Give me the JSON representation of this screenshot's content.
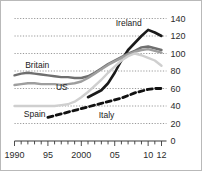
{
  "chart_data": {
    "type": "line",
    "title": "",
    "subtitle": "",
    "xlabel": "",
    "ylabel": "",
    "xlim": [
      1990,
      2012
    ],
    "ylim": [
      0,
      140
    ],
    "grid": true,
    "y_axis_position": "right",
    "legend": "inline-labels",
    "yticks": [
      0,
      20,
      40,
      60,
      80,
      100,
      120,
      140
    ],
    "ytick_labels": [
      "0",
      "20",
      "40",
      "60",
      "80",
      "100",
      "120",
      "140"
    ],
    "xticks": [
      1990,
      1995,
      2000,
      2005,
      2010,
      2012
    ],
    "xtick_labels": [
      "1990",
      "95",
      "2000",
      "05",
      "10",
      "12"
    ],
    "x": [
      1990,
      1991,
      1992,
      1993,
      1994,
      1995,
      1996,
      1997,
      1998,
      1999,
      2000,
      2001,
      2002,
      2003,
      2004,
      2005,
      2006,
      2007,
      2008,
      2009,
      2010,
      2011,
      2012
    ],
    "series": [
      {
        "name": "Ireland",
        "label": "Ireland",
        "color": "#1a1a1a",
        "style": "solid",
        "width": 2.6,
        "start_year": 2001,
        "values": [
          null,
          null,
          null,
          null,
          null,
          null,
          null,
          null,
          null,
          null,
          null,
          50,
          54,
          58,
          66,
          78,
          92,
          104,
          112,
          120,
          127,
          124,
          120
        ]
      },
      {
        "name": "Britain",
        "label": "Britain",
        "color": "#6f6f6f",
        "style": "solid",
        "width": 2.4,
        "start_year": 1990,
        "values": [
          75,
          77,
          78,
          77,
          76,
          75,
          74,
          73,
          73,
          72,
          72,
          74,
          78,
          83,
          88,
          92,
          96,
          100,
          103,
          107,
          108,
          106,
          104
        ]
      },
      {
        "name": "US",
        "label": "US",
        "color": "#9e9e9e",
        "style": "solid",
        "width": 2.4,
        "start_year": 1990,
        "values": [
          64,
          65,
          66,
          66,
          65,
          65,
          65,
          64,
          65,
          66,
          68,
          72,
          77,
          82,
          87,
          91,
          95,
          99,
          102,
          104,
          105,
          103,
          101
        ]
      },
      {
        "name": "Spain",
        "label": "Spain",
        "color": "#cfcfcf",
        "style": "solid",
        "width": 2.4,
        "start_year": 1990,
        "values": [
          40,
          40,
          40,
          40,
          40,
          40,
          40,
          41,
          42,
          45,
          50,
          56,
          63,
          70,
          78,
          85,
          92,
          97,
          100,
          98,
          95,
          92,
          86
        ]
      },
      {
        "name": "Italy",
        "label": "Italy",
        "color": "#111111",
        "style": "dashed",
        "width": 2.8,
        "start_year": 1995,
        "values": [
          null,
          null,
          null,
          null,
          null,
          27,
          29,
          31,
          33,
          35,
          37,
          39,
          41,
          43,
          45,
          47,
          49,
          52,
          55,
          57,
          59,
          60,
          60
        ]
      }
    ],
    "annotations": [
      {
        "text": "Ireland",
        "x": 2007.1,
        "y": 132,
        "anchor": "middle"
      },
      {
        "text": "Britain",
        "x": 1991.6,
        "y": 83,
        "anchor": "start"
      },
      {
        "text": "US",
        "x": 1996.2,
        "y": 58,
        "anchor": "start"
      },
      {
        "text": "Spain",
        "x": 1991.4,
        "y": 27,
        "anchor": "start"
      },
      {
        "text": "Italy",
        "x": 2002.6,
        "y": 26,
        "anchor": "start"
      }
    ]
  }
}
